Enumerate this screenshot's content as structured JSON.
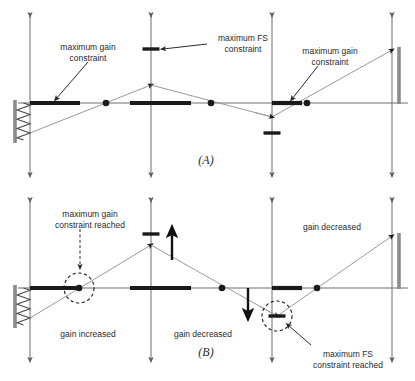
{
  "figure": {
    "width": 415,
    "height": 381,
    "background": "#ffffff"
  },
  "colors": {
    "axis": "#6e6e6e",
    "trajectory": "#9a9a9a",
    "constraint_bar": "#1a1a1a",
    "wall_bar": "#8c8c8c",
    "node": "#1a1a1a",
    "text": "#2b2b2b",
    "dashed_circle": "#1a1a1a"
  },
  "panels": [
    {
      "id": "A",
      "label": "(A)",
      "label_pos": {
        "x": 206,
        "y": 161
      },
      "baseline_y": 103,
      "axes_x": [
        30,
        151,
        272,
        392
      ],
      "annotations": [
        {
          "name": "maximum-gain-constraint-left",
          "lines": [
            "maximum gain",
            "constraint"
          ],
          "x": 88,
          "y": 48,
          "arrow": {
            "x1": 88,
            "y1": 62,
            "x2": 56,
            "y2": 99
          }
        },
        {
          "name": "maximum-fs-constraint",
          "lines": [
            "maximum FS",
            "constraint"
          ],
          "x": 243,
          "y": 39,
          "arrow": {
            "x1": 207,
            "y1": 44,
            "x2": 163,
            "y2": 49
          }
        },
        {
          "name": "maximum-gain-constraint-right",
          "lines": [
            "maximum gain",
            "constraint"
          ],
          "x": 330,
          "y": 52,
          "arrow": {
            "x1": 318,
            "y1": 66,
            "x2": 292,
            "y2": 99
          }
        }
      ],
      "gain_bars": [
        {
          "name": "gain-bar-1",
          "x1": 30,
          "x2": 80,
          "y": 103
        },
        {
          "name": "gain-bar-2",
          "x1": 130,
          "x2": 191,
          "y": 103
        },
        {
          "name": "gain-bar-3",
          "x1": 272,
          "x2": 302,
          "y": 103
        }
      ],
      "fs_ticks": [
        {
          "name": "fs-tick-upper",
          "cx": 151,
          "cy": 49,
          "w": 17
        },
        {
          "name": "fs-tick-lower",
          "cx": 272,
          "cy": 133,
          "w": 17
        }
      ],
      "nodes": [
        {
          "name": "node-1",
          "cx": 106,
          "cy": 103
        },
        {
          "name": "node-2",
          "cx": 211,
          "cy": 103
        },
        {
          "name": "node-3",
          "cx": 307,
          "cy": 103
        }
      ],
      "trajectory": [
        {
          "x": 30,
          "y": 133
        },
        {
          "x": 151,
          "y": 85
        },
        {
          "x": 272,
          "y": 117
        },
        {
          "x": 392,
          "y": 50
        }
      ],
      "wall": {
        "name": "left-wall",
        "bar": {
          "x": 15,
          "y1": 100,
          "y2": 143
        },
        "spring": {
          "x1": 17,
          "x2": 30,
          "y1": 103,
          "y2": 140,
          "coils": 4
        }
      },
      "right_bar": {
        "name": "right-scale-bar",
        "x": 399,
        "y1": 47,
        "y2": 104
      }
    },
    {
      "id": "B",
      "label": "(B)",
      "label_pos": {
        "x": 206,
        "y": 353
      },
      "baseline_y": 288,
      "axes_x": [
        30,
        151,
        272,
        392
      ],
      "annotations": [
        {
          "name": "maximum-gain-constraint-reached",
          "lines": [
            "maximum gain",
            "constraint reached"
          ],
          "x": 90,
          "y": 215,
          "arrow": {
            "x1": 80,
            "y1": 229,
            "x2": 80,
            "y2": 267
          },
          "dashed_arrow": true
        },
        {
          "name": "gain-increased",
          "lines": [
            "gain increased"
          ],
          "x": 88,
          "y": 335
        },
        {
          "name": "gain-decreased-center",
          "lines": [
            "gain decreased"
          ],
          "x": 203,
          "y": 335
        },
        {
          "name": "gain-decreased-right",
          "lines": [
            "gain decreased"
          ],
          "x": 332,
          "y": 228
        },
        {
          "name": "maximum-fs-constraint-reached",
          "lines": [
            "maximum FS",
            "constraint reached"
          ],
          "x": 348,
          "y": 355,
          "arrow": {
            "x1": 311,
            "y1": 345,
            "x2": 288,
            "y2": 325
          }
        }
      ],
      "gain_bars": [
        {
          "name": "gain-bar-1",
          "x1": 30,
          "x2": 80,
          "y": 288
        },
        {
          "name": "gain-bar-2",
          "x1": 130,
          "x2": 191,
          "y": 288
        },
        {
          "name": "gain-bar-3",
          "x1": 272,
          "x2": 302,
          "y": 288
        }
      ],
      "fs_ticks": [
        {
          "name": "fs-tick-upper",
          "cx": 151,
          "cy": 234,
          "w": 17
        },
        {
          "name": "fs-tick-lower",
          "cx": 277,
          "cy": 316,
          "w": 17
        }
      ],
      "nodes": [
        {
          "name": "node-1",
          "cx": 79,
          "cy": 288
        },
        {
          "name": "node-2",
          "cx": 222,
          "cy": 288
        },
        {
          "name": "node-3",
          "cx": 317,
          "cy": 288
        }
      ],
      "trajectory": [
        {
          "x": 30,
          "y": 318
        },
        {
          "x": 151,
          "y": 245
        },
        {
          "x": 277,
          "y": 316
        },
        {
          "x": 392,
          "y": 236
        }
      ],
      "dashed_circles": [
        {
          "name": "gain-constraint-marker",
          "cx": 79,
          "cy": 288,
          "r": 15
        },
        {
          "name": "fs-constraint-marker",
          "cx": 277,
          "cy": 316,
          "r": 15
        }
      ],
      "move_arrows": [
        {
          "name": "up-arrow-gain",
          "x": 172,
          "y1": 260,
          "y2": 231,
          "dir": "up"
        },
        {
          "name": "down-arrow-fs",
          "x": 248,
          "y1": 288,
          "y2": 315,
          "dir": "down"
        }
      ],
      "wall": {
        "name": "left-wall",
        "bar": {
          "x": 15,
          "y1": 285,
          "y2": 328
        },
        "spring": {
          "x1": 17,
          "x2": 30,
          "y1": 288,
          "y2": 325,
          "coils": 4
        }
      },
      "right_bar": {
        "name": "right-scale-bar",
        "x": 399,
        "y1": 233,
        "y2": 289
      }
    }
  ]
}
